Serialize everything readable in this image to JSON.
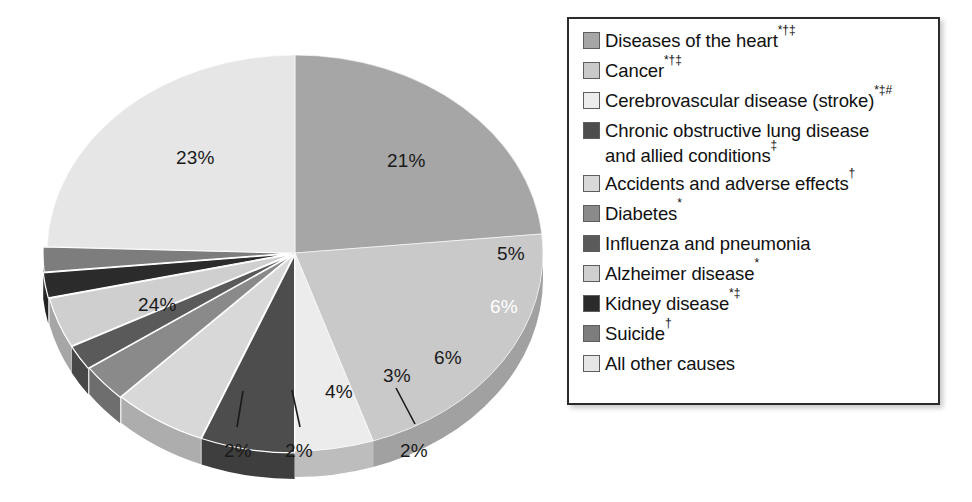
{
  "chart_data": {
    "type": "pie",
    "title": "",
    "legend_position": "right",
    "threeD": true,
    "start_angle_deg": 0,
    "direction": "clockwise",
    "unit": "%",
    "categories": [
      "Diseases of the heart",
      "Cancer",
      "Cerebrovascular disease (stroke)",
      "Chronic obstructive lung disease and allied conditions",
      "Accidents and adverse effects",
      "Diabetes",
      "Influenza and pneumonia",
      "Alzheimer disease",
      "Kidney disease",
      "Suicide",
      "All other causes"
    ],
    "values": [
      23,
      21,
      5,
      6,
      6,
      3,
      2,
      4,
      2,
      2,
      24
    ],
    "colors": [
      "#a6a6a6",
      "#c9c9c9",
      "#ececec",
      "#4d4d4d",
      "#d8d8d8",
      "#8a8a8a",
      "#5a5a5a",
      "#cfcfcf",
      "#2b2b2b",
      "#7d7d7d",
      "#e6e6e6"
    ]
  },
  "pie": {
    "labels": [
      {
        "text": "23%",
        "x": 176,
        "y": 147,
        "tone": "dark"
      },
      {
        "text": "21%",
        "x": 387,
        "y": 150,
        "tone": "dark"
      },
      {
        "text": "5%",
        "x": 497,
        "y": 243,
        "tone": "dark"
      },
      {
        "text": "6%",
        "x": 490,
        "y": 296,
        "tone": "light"
      },
      {
        "text": "6%",
        "x": 434,
        "y": 347,
        "tone": "dark"
      },
      {
        "text": "3%",
        "x": 383,
        "y": 365,
        "tone": "dark"
      },
      {
        "text": "2%",
        "x": 400,
        "y": 440,
        "tone": "dark"
      },
      {
        "text": "4%",
        "x": 325,
        "y": 381,
        "tone": "dark"
      },
      {
        "text": "2%",
        "x": 285,
        "y": 440,
        "tone": "dark"
      },
      {
        "text": "2%",
        "x": 224,
        "y": 440,
        "tone": "dark"
      },
      {
        "text": "24%",
        "x": 138,
        "y": 294,
        "tone": "dark"
      }
    ]
  },
  "legend": {
    "items": [
      {
        "label": "Diseases of the heart",
        "sup": "*†‡",
        "color": "#a6a6a6",
        "swatch_name": "legend-swatch-heart"
      },
      {
        "label": "Cancer",
        "sup": "*†‡",
        "color": "#c9c9c9",
        "swatch_name": "legend-swatch-cancer"
      },
      {
        "label": "Cerebrovascular disease (stroke)",
        "sup": "*‡#",
        "color": "#ececec",
        "swatch_name": "legend-swatch-stroke"
      },
      {
        "label": "Chronic obstructive lung disease",
        "label2": "and allied conditions",
        "sup2": "‡",
        "sup": "",
        "color": "#4d4d4d",
        "swatch_name": "legend-swatch-copd"
      },
      {
        "label": "Accidents and adverse effects",
        "sup": "†",
        "color": "#d8d8d8",
        "swatch_name": "legend-swatch-accidents"
      },
      {
        "label": "Diabetes",
        "sup": "*",
        "color": "#8a8a8a",
        "swatch_name": "legend-swatch-diabetes"
      },
      {
        "label": "Influenza and pneumonia",
        "sup": "",
        "color": "#5a5a5a",
        "swatch_name": "legend-swatch-influenza"
      },
      {
        "label": "Alzheimer disease",
        "sup": "*",
        "color": "#cfcfcf",
        "swatch_name": "legend-swatch-alzheimer"
      },
      {
        "label": "Kidney disease",
        "sup": "*‡",
        "color": "#2b2b2b",
        "swatch_name": "legend-swatch-kidney"
      },
      {
        "label": "Suicide",
        "sup": "†",
        "color": "#7d7d7d",
        "swatch_name": "legend-swatch-suicide"
      },
      {
        "label": "All other causes",
        "sup": "",
        "color": "#e6e6e6",
        "swatch_name": "legend-swatch-other"
      }
    ]
  }
}
